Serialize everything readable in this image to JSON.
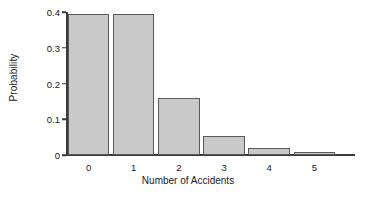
{
  "chart_data": {
    "type": "bar",
    "title": "",
    "xlabel": "Number of Accidents",
    "ylabel": "Probability",
    "categories": [
      "0",
      "1",
      "2",
      "3",
      "4",
      "5"
    ],
    "values": [
      0.395,
      0.395,
      0.16,
      0.053,
      0.021,
      0.008
    ],
    "xlim": [
      -0.5,
      5.9
    ],
    "ylim": [
      0,
      0.4
    ],
    "ytick_labels": [
      "0",
      "0.1",
      "0.2",
      "0.3",
      "0.4"
    ],
    "ytick_values": [
      0,
      0.1,
      0.2,
      0.3,
      0.4
    ],
    "xtick_labels": [
      "0",
      "1",
      "2",
      "3",
      "4",
      "5"
    ],
    "grid": false,
    "legend": null,
    "bar_fill_color": "#c9c9c9",
    "bar_edge_color": "#5a5a5a",
    "axis_color": "#3a3a3a",
    "background_color": "#ffffff"
  }
}
